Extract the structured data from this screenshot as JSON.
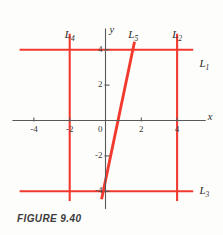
{
  "figure": {
    "caption": "FIGURE  9.40",
    "background_color": "#fdfdfb",
    "line_color": "#f2392e",
    "axis_color": "#595959",
    "text_color": "#2b2b2b"
  },
  "axes": {
    "x_axis_label": "x",
    "y_axis_label": "y",
    "x_ticks": [
      {
        "value": -4,
        "label": "-4"
      },
      {
        "value": -2,
        "label": "-2"
      },
      {
        "value": 2,
        "label": "2"
      },
      {
        "value": 4,
        "label": "4"
      }
    ],
    "y_ticks": [
      {
        "value": 4,
        "label": "4"
      },
      {
        "value": 2,
        "label": "2"
      },
      {
        "value": -2,
        "label": "-2"
      },
      {
        "value": -4,
        "label": "-4"
      }
    ],
    "origin_label": "0",
    "xlim": [
      -5.2,
      5.6
    ],
    "ylim": [
      -5.0,
      5.2
    ]
  },
  "chart_data": {
    "type": "line",
    "title": "FIGURE  9.40",
    "xlabel": "x",
    "ylabel": "y",
    "xlim": [
      -5.2,
      5.6
    ],
    "ylim": [
      -5.0,
      5.2
    ],
    "grid": false,
    "legend": "inline-labels",
    "series": [
      {
        "name": "L1",
        "label": "L",
        "sub": "1",
        "kind": "horizontal",
        "equation": "y = 4",
        "y": 4,
        "x_start": -4.8,
        "x_end": 4.9,
        "label_x": 5.25,
        "label_y": 3.55
      },
      {
        "name": "L2",
        "label": "L",
        "sub": "2",
        "kind": "vertical",
        "equation": "x = 4",
        "x": 4,
        "y_start": 4.9,
        "y_end": -4.55,
        "label_x": 4.0,
        "label_y": 5.15
      },
      {
        "name": "L3",
        "label": "L",
        "sub": "3",
        "kind": "horizontal",
        "equation": "y = -4",
        "y": -4,
        "x_start": -4.8,
        "x_end": 4.9,
        "label_x": 5.25,
        "label_y": -3.62
      },
      {
        "name": "L4",
        "label": "L",
        "sub": "4",
        "kind": "vertical",
        "equation": "x = -2",
        "x": -2,
        "y_start": 4.9,
        "y_end": -4.55,
        "label_x": -2.0,
        "label_y": 5.15
      },
      {
        "name": "L5",
        "label": "L",
        "sub": "5",
        "kind": "slanted",
        "equation": "y = 4.8x - 3.3",
        "x_start": -0.22,
        "y_start": -4.45,
        "x_end": 1.62,
        "y_end": 4.45,
        "label_x": 1.55,
        "label_y": 5.15
      }
    ]
  }
}
